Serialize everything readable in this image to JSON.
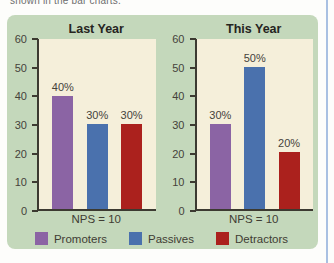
{
  "page": {
    "caption_clipped": "shown in the bar charts.",
    "colors": {
      "panel_bg": "#c4d8bb",
      "plot_bg": "#f5efda",
      "axis": "#3c3a31",
      "text": "#45423a",
      "title": "#26251f",
      "page_border": "#a9c0e2",
      "page_bg": "#fdfdfb"
    }
  },
  "chart_data": [
    {
      "type": "bar",
      "title": "Last Year",
      "categories": [
        "Promoters",
        "Passives",
        "Detractors"
      ],
      "values": [
        40,
        30,
        30
      ],
      "value_labels": [
        "40%",
        "30%",
        "30%"
      ],
      "bar_colors": [
        "#8b64a4",
        "#4a71ad",
        "#ab211d"
      ],
      "ylim": [
        0,
        60
      ],
      "yticks": [
        0,
        10,
        20,
        30,
        40,
        50,
        60
      ],
      "xlabel": "NPS = 10",
      "ylabel": "",
      "grid": false,
      "legend_position": "bottom-shared"
    },
    {
      "type": "bar",
      "title": "This Year",
      "categories": [
        "Promoters",
        "Passives",
        "Detractors"
      ],
      "values": [
        30,
        50,
        20
      ],
      "value_labels": [
        "30%",
        "50%",
        "20%"
      ],
      "bar_colors": [
        "#8b64a4",
        "#4a71ad",
        "#ab211d"
      ],
      "ylim": [
        0,
        60
      ],
      "yticks": [
        0,
        10,
        20,
        30,
        40,
        50,
        60
      ],
      "xlabel": "NPS = 10",
      "ylabel": "",
      "grid": false,
      "legend_position": "bottom-shared"
    }
  ],
  "legend": {
    "position": "bottom-center",
    "items": [
      {
        "label": "Promoters",
        "color": "#8b64a4"
      },
      {
        "label": "Passives",
        "color": "#4a71ad"
      },
      {
        "label": "Detractors",
        "color": "#ab211d"
      }
    ]
  }
}
